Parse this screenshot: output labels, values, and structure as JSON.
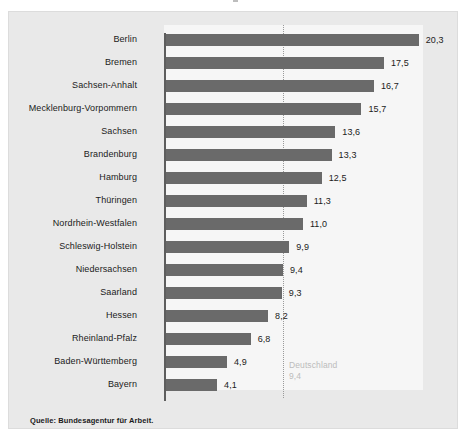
{
  "figure": {
    "panel_background": "#e9e9e9",
    "plot_background": "#f6f6f6",
    "bar_color": "#6a6a6a",
    "axis_color": "#5d5d5d",
    "reference_line_color": "#9a9a9a",
    "source_note": "Quelle: Bundesagentur für Arbeit."
  },
  "annotation": {
    "reference_name": "Deutschland",
    "reference_value_label": "9,4"
  },
  "chart_data": {
    "type": "bar",
    "orientation": "horizontal",
    "title": "",
    "subtitle": "",
    "xlabel": "",
    "ylabel": "",
    "xlim": [
      0,
      21
    ],
    "grid": false,
    "legend": "none",
    "value_label_format": "comma-decimal",
    "categories": [
      "Berlin",
      "Bremen",
      "Sachsen-Anhalt",
      "Mecklenburg-Vorpommern",
      "Sachsen",
      "Brandenburg",
      "Hamburg",
      "Thüringen",
      "Nordrhein-Westfalen",
      "Schleswig-Holstein",
      "Niedersachsen",
      "Saarland",
      "Hessen",
      "Rheinland-Pfalz",
      "Baden-Württemberg",
      "Bayern"
    ],
    "values": [
      20.3,
      17.5,
      16.7,
      15.7,
      13.6,
      13.3,
      12.5,
      11.3,
      11.0,
      9.9,
      9.4,
      9.3,
      8.2,
      6.8,
      4.9,
      4.1
    ],
    "value_labels": [
      "20,3",
      "17,5",
      "16,7",
      "15,7",
      "13,6",
      "13,3",
      "12,5",
      "11,3",
      "11,0",
      "9,9",
      "9,4",
      "9,3",
      "8,2",
      "6,8",
      "4,9",
      "4,1"
    ],
    "reference_line": {
      "label": "Deutschland",
      "value": 9.4,
      "value_label": "9,4",
      "style": "dotted"
    }
  }
}
